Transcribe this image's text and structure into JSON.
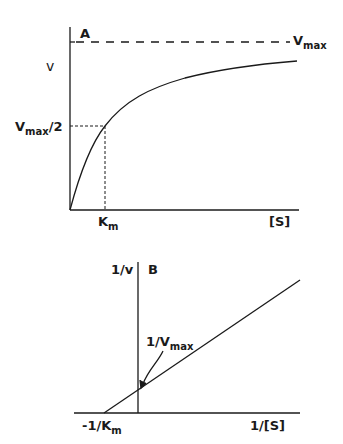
{
  "panel_a": {
    "label": "A",
    "y_axis_label": "v",
    "x_axis_label": "[S]",
    "vmax_label": {
      "main": "V",
      "sub": "max"
    },
    "half_vmax_label": {
      "main": "V",
      "sub": "max",
      "suffix": "/2"
    },
    "km_label": {
      "main": "K",
      "sub": "m"
    },
    "description": "Michaelis-Menten hyperbolic curve of velocity v vs substrate concentration [S]"
  },
  "panel_b": {
    "label": "B",
    "y_axis_label": "1/v",
    "x_axis_label": "1/[S]",
    "y_intercept_label": {
      "main": "1/V",
      "sub": "max"
    },
    "x_intercept_label": {
      "main": "-1/K",
      "sub": "m"
    },
    "description": "Lineweaver-Burk double reciprocal plot"
  },
  "colors": {
    "ink": "#1a1a1a",
    "background": "#ffffff"
  }
}
